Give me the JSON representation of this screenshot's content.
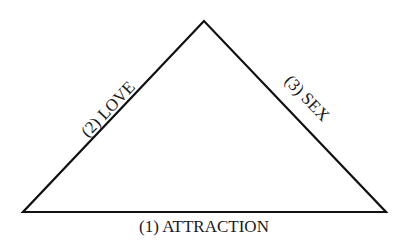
{
  "diagram": {
    "type": "triangle",
    "stroke_color": "#111111",
    "background": "#ffffff",
    "vertices": {
      "apex": [
        204,
        21
      ],
      "bottom_left": [
        23,
        212
      ],
      "bottom_right": [
        386,
        212
      ]
    },
    "sides": {
      "bottom": {
        "label": "(1) ATTRACTION"
      },
      "left": {
        "label": "(2) LOVE"
      },
      "right": {
        "label": "(3) SEX"
      }
    }
  }
}
